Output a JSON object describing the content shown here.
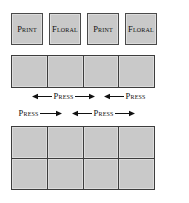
{
  "diagram": {
    "colors": {
      "fabric_fill": "#c9c9c9",
      "seam_line": "#3d3d3d",
      "background": "#ffffff",
      "text": "#111111"
    },
    "patch_row": {
      "name": "cut-squares-row",
      "patches": [
        {
          "label": "Print"
        },
        {
          "label": "Floral"
        },
        {
          "label": "Print"
        },
        {
          "label": "Floral"
        }
      ]
    },
    "strip": {
      "name": "sewn-strip",
      "rows": 1,
      "columns": 4,
      "cells": [
        {
          "label": ""
        },
        {
          "label": ""
        },
        {
          "label": ""
        },
        {
          "label": ""
        }
      ]
    },
    "press_band_upper": {
      "name": "press-directions-below-strip",
      "groups": [
        {
          "label": "Press",
          "left_arrow": true,
          "right_arrow": true,
          "left_px": 32,
          "width_px": 66
        },
        {
          "label": "Press",
          "left_arrow": true,
          "right_arrow": false,
          "left_px": 104,
          "width_px": 55
        }
      ]
    },
    "press_band_lower": {
      "name": "press-directions-above-grid",
      "groups": [
        {
          "label": "Press",
          "left_arrow": false,
          "right_arrow": true,
          "left_px": 17,
          "width_px": 55
        },
        {
          "label": "Press",
          "left_arrow": true,
          "right_arrow": true,
          "left_px": 72,
          "width_px": 66
        }
      ]
    },
    "grid": {
      "name": "assembled-block",
      "rows": 2,
      "columns": 4,
      "cells": [
        [
          {
            "label": ""
          },
          {
            "label": ""
          },
          {
            "label": ""
          },
          {
            "label": ""
          }
        ],
        [
          {
            "label": ""
          },
          {
            "label": ""
          },
          {
            "label": ""
          },
          {
            "label": ""
          }
        ]
      ]
    }
  }
}
